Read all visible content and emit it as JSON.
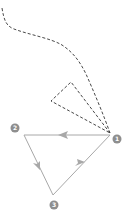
{
  "diagram": {
    "colors": {
      "edge": "#a8a8a8",
      "dashed": "#333333",
      "node": "#8e8e8e",
      "node_text": "#ffffff"
    },
    "nodes": [
      {
        "id": "1",
        "label": "1"
      },
      {
        "id": "2",
        "label": "2"
      },
      {
        "id": "3",
        "label": "3"
      }
    ],
    "edges": [
      {
        "from": "1",
        "to": "2",
        "style": "solid",
        "arrow": "mid"
      },
      {
        "from": "2",
        "to": "3",
        "style": "solid",
        "arrow": "mid"
      },
      {
        "from": "3",
        "to": "1",
        "style": "solid",
        "arrow": "mid"
      }
    ],
    "dashed_paths": [
      {
        "name": "incoming-curve",
        "style": "dashed"
      },
      {
        "name": "dashed-triangle",
        "style": "dashed"
      }
    ]
  }
}
